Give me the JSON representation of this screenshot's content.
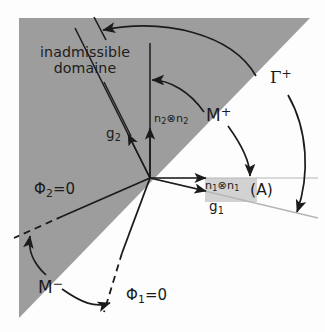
{
  "figure": {
    "kind": "schematic-diagram",
    "caption_labels": {
      "inadmissible_line1": "inadmissible",
      "inadmissible_line2": "domaine",
      "g2": "g",
      "g2_sub": "2",
      "n2n2_base": "n",
      "n2n2_sub": "2",
      "n2n2_op": "⊗",
      "n2n2_base2": "n",
      "n2n2_sub2": "2",
      "m_plus_base": "M",
      "m_plus_sup": "+",
      "gamma_plus_base": "Γ",
      "gamma_plus_sup": "+",
      "phi2_base": "Φ",
      "phi2_sub": "2",
      "phi2_eq": "=0",
      "n1n1_base": "n",
      "n1n1_sub": "1",
      "n1n1_op": "⊗",
      "n1n1_base2": "n",
      "n1n1_sub2": "1",
      "region_a": "(A)",
      "g1": "g",
      "g1_sub": "1",
      "m_minus_base": "M",
      "m_minus_sup": "−",
      "phi1_base": "Φ",
      "phi1_sub": "1",
      "phi1_eq": "=0"
    },
    "colors": {
      "inadmissible_fill": "#9d9d9d",
      "strip_a_fill": "#d2d2d2",
      "background": "#fdfdfd",
      "stroke": "#1b1b1b",
      "label_text": "#1c1c1c",
      "thin_stroke": "#8c8c8c"
    },
    "geometry": {
      "origin_x": 150,
      "origin_y": 178,
      "inadmissible_polygon": "28,18 310,18 19,318 19,18",
      "strip_a_rect": {
        "x": 205,
        "y": 178,
        "w": 52,
        "h": 24
      }
    }
  }
}
